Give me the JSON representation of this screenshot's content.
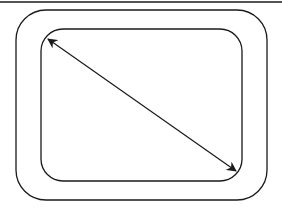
{
  "diagram": {
    "background": "#ffffff",
    "stroke_color": "#1a1a1a",
    "top_rule": {
      "x1": 0,
      "y1": 2,
      "x2": 282,
      "y2": 2
    },
    "outer_rect": {
      "x": 16,
      "y": 10,
      "width": 251,
      "height": 190,
      "radius": 30
    },
    "inner_rect": {
      "x": 41,
      "y": 29,
      "width": 201,
      "height": 152,
      "radius": 22
    },
    "diagonal_arrow": {
      "from": [
        48,
        39
      ],
      "to": [
        236,
        171
      ],
      "double_headed": true
    }
  }
}
